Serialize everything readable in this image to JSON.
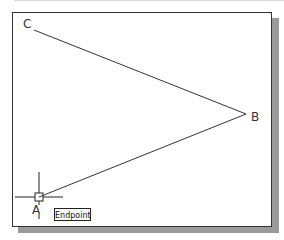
{
  "canvas": {
    "background": "#ffffff",
    "frame_border_color": "#333333",
    "shadow_color": "#9a9a9a"
  },
  "points": {
    "A": {
      "label": "A",
      "x": 39,
      "y": 197
    },
    "B": {
      "label": "B",
      "x": 246,
      "y": 114
    },
    "C": {
      "label": "C",
      "x": 34,
      "y": 30
    }
  },
  "lines": [
    {
      "from": "C",
      "to": "B"
    },
    {
      "from": "B",
      "to": "A"
    }
  ],
  "cursor": {
    "type": "crosshair-with-aperture",
    "x": 39,
    "y": 197
  },
  "osnap_tooltip": {
    "label": "Endpoint"
  }
}
